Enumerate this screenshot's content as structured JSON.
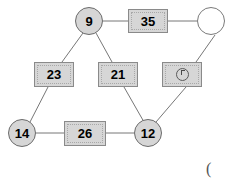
{
  "diagram": {
    "canvas": {
      "width": 230,
      "height": 181
    },
    "style": {
      "node_fill": "#d6d6d6",
      "empty_node_fill": "#ffffff",
      "node_stroke": "#8a8a8a",
      "circle_stroke": "#6b6b6b",
      "edge_color": "#777777",
      "background": "#ffffff",
      "label_color": "#000000"
    },
    "nodes": [
      {
        "id": "n9",
        "label": "9",
        "shape": "circle",
        "x": 89,
        "y": 21,
        "w": 28,
        "h": 28,
        "filled": true
      },
      {
        "id": "n35",
        "label": "35",
        "shape": "rect",
        "x": 148,
        "y": 21,
        "w": 40,
        "h": 24,
        "filled": true
      },
      {
        "id": "nEmpty",
        "label": "",
        "shape": "circle",
        "x": 211,
        "y": 21,
        "w": 28,
        "h": 28,
        "filled": false
      },
      {
        "id": "n23",
        "label": "23",
        "shape": "rect",
        "x": 54,
        "y": 74,
        "w": 40,
        "h": 25,
        "filled": true
      },
      {
        "id": "n21",
        "label": "21",
        "shape": "rect",
        "x": 118,
        "y": 74,
        "w": 40,
        "h": 25,
        "filled": true
      },
      {
        "id": "nGlyph",
        "label": "",
        "shape": "rect",
        "x": 182,
        "y": 74,
        "w": 40,
        "h": 25,
        "filled": true,
        "glyph": "ring-tick-mark"
      },
      {
        "id": "n14",
        "label": "14",
        "shape": "circle",
        "x": 22,
        "y": 133,
        "w": 28,
        "h": 28,
        "filled": true
      },
      {
        "id": "n26",
        "label": "26",
        "shape": "rect",
        "x": 85,
        "y": 133,
        "w": 42,
        "h": 25,
        "filled": true
      },
      {
        "id": "n12",
        "label": "12",
        "shape": "circle",
        "x": 148,
        "y": 133,
        "w": 28,
        "h": 28,
        "filled": true
      }
    ],
    "edges": [
      {
        "from": "n9",
        "to": "n35"
      },
      {
        "from": "n35",
        "to": "nEmpty"
      },
      {
        "from": "n9",
        "to": "n23"
      },
      {
        "from": "n9",
        "to": "n21"
      },
      {
        "from": "nEmpty",
        "to": "nGlyph"
      },
      {
        "from": "n23",
        "to": "n14"
      },
      {
        "from": "n21",
        "to": "n12"
      },
      {
        "from": "nGlyph",
        "to": "n12"
      },
      {
        "from": "n14",
        "to": "n26"
      },
      {
        "from": "n26",
        "to": "n12"
      }
    ],
    "annotations": [
      {
        "id": "corner",
        "text": "(",
        "x": 206,
        "y": 160
      }
    ]
  }
}
